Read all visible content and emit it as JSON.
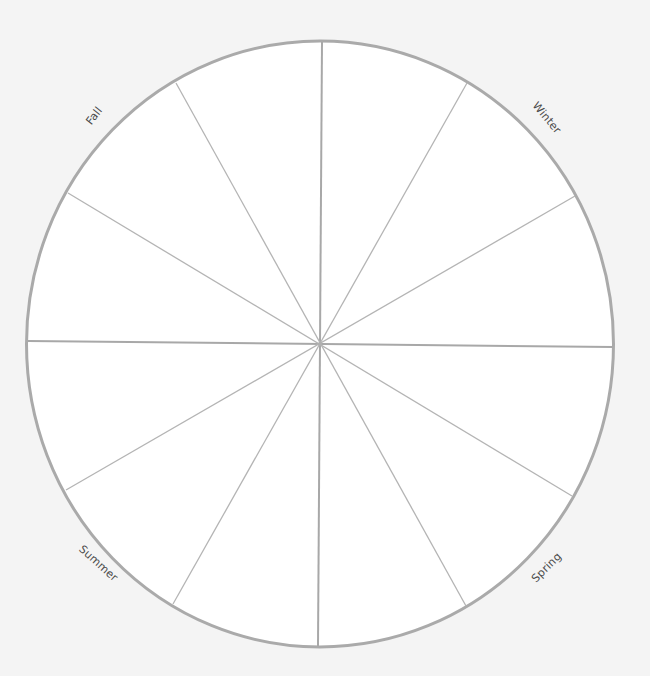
{
  "diagram": {
    "type": "seasonal-wheel",
    "segment_count": 12,
    "colors": {
      "background": "#f4f4f4",
      "wheel_fill": "#ffffff",
      "rim": "#aaaaaa",
      "spoke": "#b4b4b4",
      "label_text": "#4a4a4a"
    },
    "labels": {
      "fall": "Fall",
      "winter": "Winter",
      "summer": "Summer",
      "spring": "Spring"
    }
  }
}
